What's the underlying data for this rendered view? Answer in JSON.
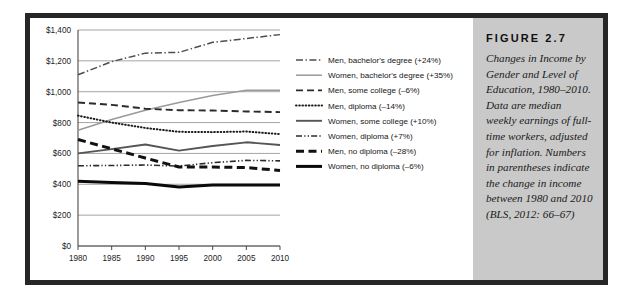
{
  "figure": {
    "label": "FIGURE  2.7",
    "caption": "Changes in Income by Gender and Level of Education, 1980–2010. Data are median weekly earnings of full-time workers, adjusted for inflation. Numbers in parentheses indicate the change in income between 1980 and 2010 (BLS, 2012: 66–67)",
    "panel_color": "#c9c9c9",
    "frame_color": "#262626"
  },
  "chart_data": {
    "type": "line",
    "title": "",
    "xlabel": "",
    "ylabel": "",
    "x": [
      1980,
      1985,
      1990,
      1995,
      2000,
      2005,
      2010
    ],
    "xtick_labels": [
      "1980",
      "1985",
      "1990",
      "1995",
      "2000",
      "2005",
      "2010"
    ],
    "ylim": [
      0,
      1400
    ],
    "ytick_values": [
      0,
      200,
      400,
      600,
      800,
      1000,
      1200,
      1400
    ],
    "ytick_labels": [
      "$0",
      "$200",
      "$400",
      "$600",
      "$800",
      "$1,000",
      "$1,200",
      "$1,400"
    ],
    "grid": "horizontal",
    "legend_position": "right",
    "series": [
      {
        "name": "Men, bachelor's degree (+24%)",
        "style": "dash-dot",
        "color": "#4d4d4d",
        "width": 1.5,
        "values": [
          1110,
          1195,
          1250,
          1255,
          1320,
          1345,
          1370
        ]
      },
      {
        "name": "Women, bachelor's degree (+35%)",
        "style": "solid",
        "color": "#9a9a9a",
        "width": 1.5,
        "values": [
          750,
          820,
          880,
          930,
          975,
          1010,
          1010
        ]
      },
      {
        "name": "Men, some college (–6%)",
        "style": "dashed",
        "color": "#2b2b2b",
        "width": 1.9,
        "values": [
          930,
          915,
          890,
          880,
          878,
          872,
          868
        ]
      },
      {
        "name": "Men, diploma (–14%)",
        "style": "dotted",
        "color": "#1a1a1a",
        "width": 2.0,
        "values": [
          845,
          800,
          765,
          740,
          738,
          742,
          725
        ]
      },
      {
        "name": "Women, some college (+10%)",
        "style": "solid",
        "color": "#555555",
        "width": 1.9,
        "values": [
          600,
          628,
          658,
          618,
          648,
          672,
          655
        ]
      },
      {
        "name": "Women, diploma (+7%)",
        "style": "dash-dot-dot",
        "color": "#2b2b2b",
        "width": 1.6,
        "values": [
          520,
          522,
          525,
          518,
          540,
          555,
          552
        ]
      },
      {
        "name": "Men, no diploma (–28%)",
        "style": "bold-dashed",
        "color": "#111111",
        "width": 3.0,
        "values": [
          690,
          630,
          570,
          512,
          512,
          508,
          490
        ]
      },
      {
        "name": "Women, no diploma (–6%)",
        "style": "bold-solid",
        "color": "#0a0a0a",
        "width": 3.0,
        "values": [
          420,
          412,
          405,
          382,
          395,
          396,
          395
        ]
      }
    ]
  }
}
